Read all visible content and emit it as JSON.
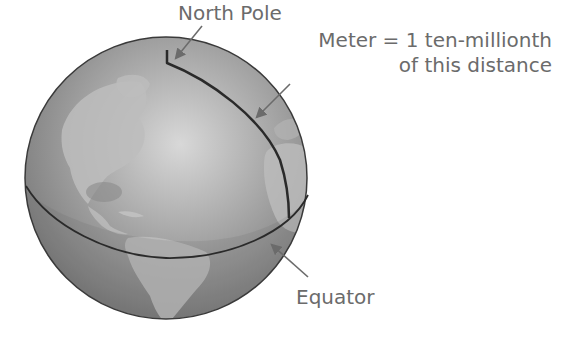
{
  "diagram": {
    "labels": {
      "north_pole": "North Pole",
      "meter_line1": "Meter = 1 ten-millionth",
      "meter_line2": "of this distance",
      "equator": "Equator"
    },
    "colors": {
      "background": "#ffffff",
      "globe_ocean": "#8e8e8e",
      "globe_land": "#b4b4b4",
      "globe_highlight": "#d6d6d6",
      "line": "#2a2a2a",
      "label_text": "#6b6b6b",
      "arrow": "#6b6b6b"
    }
  }
}
